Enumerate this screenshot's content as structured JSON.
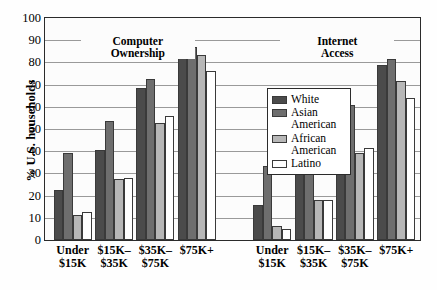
{
  "chart_data": {
    "type": "bar",
    "title": "",
    "xlabel": "",
    "ylabel": "% U.S. households",
    "ylim": [
      0,
      100
    ],
    "yticks": [
      0,
      10,
      20,
      30,
      40,
      50,
      60,
      70,
      80,
      90,
      100
    ],
    "grid": true,
    "legend_position": "center",
    "panels": [
      {
        "name": "Computer Ownership",
        "header_line1": "Computer",
        "header_line2": "Ownership",
        "categories": [
          "Under $15K",
          "$15K–$35K",
          "$35K–$75K",
          "$75K+"
        ],
        "category_lines": [
          [
            "Under",
            "$15K"
          ],
          [
            "$15K–",
            "$35K"
          ],
          [
            "$35K–",
            "$75K"
          ],
          [
            "$75K+",
            ""
          ]
        ],
        "series": [
          {
            "name": "White",
            "values": [
              22.5,
              40.5,
              68.5,
              87.0
            ]
          },
          {
            "name": "Asian American",
            "values": [
              39.0,
              53.5,
              72.5,
              87.0
            ]
          },
          {
            "name": "African American",
            "values": [
              11.5,
              27.5,
              52.5,
              83.5
            ]
          },
          {
            "name": "Latino",
            "values": [
              12.5,
              28.0,
              56.0,
              76.0
            ]
          }
        ]
      },
      {
        "name": "Internet Access",
        "header_line1": "Internet",
        "header_line2": "Access",
        "categories": [
          "Under $15K",
          "$15K–$35K",
          "$35K–$75K",
          "$75K+"
        ],
        "category_lines": [
          [
            "Under",
            "$15K"
          ],
          [
            "$15K–",
            "$35K"
          ],
          [
            "$35K–",
            "$75K"
          ],
          [
            "$75K+",
            ""
          ]
        ],
        "series": [
          {
            "name": "White",
            "values": [
              16.0,
              31.0,
              56.5,
              79.0
            ]
          },
          {
            "name": "Asian American",
            "values": [
              33.5,
              44.0,
              61.0,
              81.5
            ]
          },
          {
            "name": "African American",
            "values": [
              6.5,
              18.0,
              39.0,
              71.5
            ]
          },
          {
            "name": "Latino",
            "values": [
              5.0,
              18.0,
              41.5,
              64.0
            ]
          }
        ]
      }
    ],
    "legend": [
      {
        "label": "White",
        "color": "#4b4b4b"
      },
      {
        "label": "Asian American",
        "color": "#6e6e6e"
      },
      {
        "label": "African American",
        "color": "#b7b7b7"
      },
      {
        "label": "Latino",
        "color": "#ffffff"
      }
    ],
    "colors": {
      "white_series": "#4b4b4b",
      "asian_american_series": "#6e6e6e",
      "african_american_series": "#b7b7b7",
      "latino_series": "#ffffff",
      "axis": "#2b2b2b",
      "gridline": "#9a9a9a",
      "background": "#fcfcfc"
    }
  }
}
